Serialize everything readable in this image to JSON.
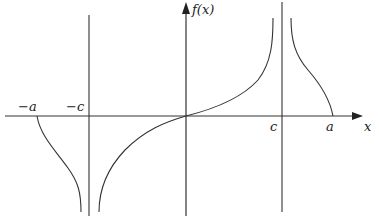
{
  "figure": {
    "type": "function-graph",
    "colors": {
      "stroke": "#333333",
      "background": "#ffffff"
    },
    "axes": {
      "x_label": "x",
      "y_label": "f(x)"
    },
    "tick_labels": {
      "neg_a": "−a",
      "neg_c": "−c",
      "c": "c",
      "a": "a"
    },
    "asymptotes": [
      "x = −c",
      "x = c"
    ]
  }
}
